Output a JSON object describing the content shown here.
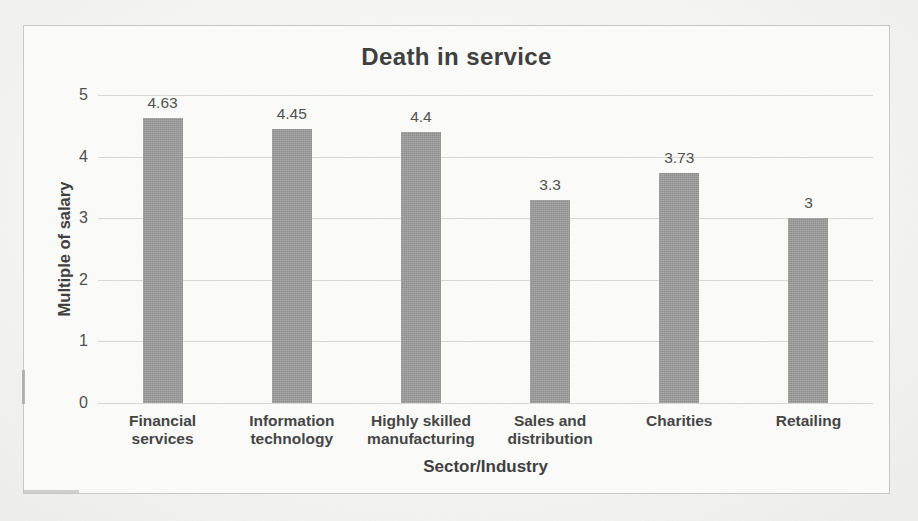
{
  "page": {
    "background": "#f4f4f2",
    "panel_background": "#fcfcfb",
    "panel_border_color": "#c9c9c6"
  },
  "chart_data": {
    "type": "bar",
    "title": "Death in service",
    "xlabel": "Sector/Industry",
    "ylabel": "Multiple of salary",
    "categories": [
      "Financial services",
      "Information technology",
      "Highly skilled manufacturing",
      "Sales and distribution",
      "Charities",
      "Retailing"
    ],
    "values": [
      4.63,
      4.45,
      4.4,
      3.3,
      3.73,
      3
    ],
    "data_labels": [
      "4.63",
      "4.45",
      "4.4",
      "3.3",
      "3.73",
      "3"
    ],
    "ylim": [
      0,
      5
    ],
    "yticks": [
      "0",
      "1",
      "2",
      "3",
      "4",
      "5"
    ],
    "grid": true,
    "legend": false,
    "bar_color": "#9c9c9c",
    "gridline_color": "#d8d8d5",
    "title_color": "#3d3d3d",
    "tick_label_color": "#4c4c4c",
    "data_label_color": "#4f4f4f",
    "category_label_color": "#434343"
  }
}
